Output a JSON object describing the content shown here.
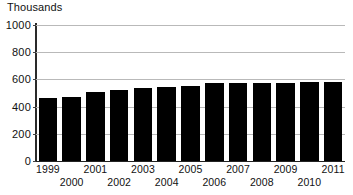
{
  "chart_data": {
    "type": "bar",
    "title": "Thousands",
    "xlabel": "",
    "ylabel": "Thousands",
    "categories": [
      "1999",
      "2000",
      "2001",
      "2002",
      "2003",
      "2004",
      "2005",
      "2006",
      "2007",
      "2008",
      "2009",
      "2010",
      "2011"
    ],
    "values": [
      465,
      470,
      505,
      520,
      540,
      545,
      550,
      570,
      572,
      572,
      573,
      580,
      578
    ],
    "ylim": [
      0,
      1000
    ],
    "ytick_labels": [
      "0",
      "200",
      "400",
      "600",
      "800",
      "1000"
    ],
    "ytick_values": [
      0,
      200,
      400,
      600,
      800,
      1000
    ],
    "grid": true,
    "legend": false,
    "bar_color": "#000000",
    "gridline_color": "#b9b9b9",
    "axis_color": "#2a2a2a",
    "background_color": "#ffffff"
  }
}
